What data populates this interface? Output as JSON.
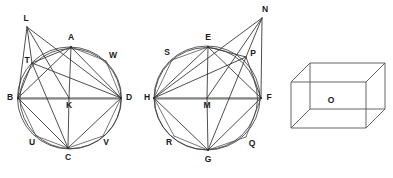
{
  "figure": {
    "background_color": "#ffffff",
    "ink_color": "#3a3a3a",
    "label_color": "#1a1a1a",
    "width": 393,
    "height": 178
  },
  "diagrams": [
    {
      "id": "left-circle-diagram",
      "name": "circle-with-inscribed-quadrilateral-abcd",
      "center": {
        "x": 69.5,
        "y": 98
      },
      "radius": 52,
      "points": [
        {
          "key": "A",
          "label": "A",
          "x": 71,
          "y": 47,
          "label_x": 71,
          "label_y": 38,
          "on_circle": true,
          "role": "top-vertex"
        },
        {
          "key": "B",
          "label": "B",
          "x": 18,
          "y": 98,
          "label_x": 10,
          "label_y": 98,
          "on_circle": true,
          "role": "left-vertex"
        },
        {
          "key": "C",
          "label": "C",
          "x": 68,
          "y": 148,
          "label_x": 68,
          "label_y": 158,
          "on_circle": true,
          "role": "bottom-vertex"
        },
        {
          "key": "D",
          "label": "D",
          "x": 121,
          "y": 98,
          "label_x": 129,
          "label_y": 98,
          "on_circle": true,
          "role": "right-vertex"
        },
        {
          "key": "K",
          "label": "K",
          "x": 69,
          "y": 98,
          "label_x": 69,
          "label_y": 106,
          "on_circle": false,
          "role": "center"
        },
        {
          "key": "L",
          "label": "L",
          "x": 27,
          "y": 27,
          "label_x": 26,
          "label_y": 19,
          "on_circle": false,
          "role": "external-apex"
        },
        {
          "key": "T",
          "label": "T",
          "x": 32,
          "y": 63,
          "label_x": 27,
          "label_y": 61,
          "on_circle": true,
          "role": "upper-left-arc"
        },
        {
          "key": "W",
          "label": "W",
          "x": 106,
          "y": 61,
          "label_x": 113,
          "label_y": 56,
          "on_circle": true,
          "role": "upper-right-arc"
        },
        {
          "key": "U",
          "label": "U",
          "x": 36,
          "y": 136,
          "label_x": 32,
          "label_y": 143,
          "on_circle": true,
          "role": "lower-left-arc"
        },
        {
          "key": "V",
          "label": "V",
          "x": 103,
          "y": 136,
          "label_x": 106,
          "label_y": 143,
          "on_circle": true,
          "role": "lower-right-arc"
        }
      ],
      "segments": [
        [
          "B",
          "D"
        ],
        [
          "A",
          "B"
        ],
        [
          "A",
          "D"
        ],
        [
          "B",
          "C"
        ],
        [
          "C",
          "D"
        ],
        [
          "A",
          "K"
        ],
        [
          "C",
          "K"
        ],
        [
          "A",
          "C"
        ],
        [
          "L",
          "B"
        ],
        [
          "L",
          "T"
        ],
        [
          "L",
          "K"
        ],
        [
          "L",
          "D"
        ],
        [
          "T",
          "B"
        ],
        [
          "T",
          "D"
        ],
        [
          "T",
          "A"
        ],
        [
          "T",
          "C"
        ],
        [
          "A",
          "W"
        ],
        [
          "W",
          "D"
        ],
        [
          "B",
          "U"
        ],
        [
          "U",
          "C"
        ],
        [
          "C",
          "V"
        ],
        [
          "V",
          "D"
        ],
        [
          "B",
          "K"
        ],
        [
          "K",
          "D"
        ]
      ]
    },
    {
      "id": "middle-circle-diagram",
      "name": "circle-with-inscribed-quadrilateral-efgh",
      "center": {
        "x": 207,
        "y": 98
      },
      "radius": 53,
      "points": [
        {
          "key": "E",
          "label": "E",
          "x": 208,
          "y": 47,
          "label_x": 208,
          "label_y": 38,
          "on_circle": true,
          "role": "top-vertex"
        },
        {
          "key": "H",
          "label": "H",
          "x": 154,
          "y": 98,
          "label_x": 147,
          "label_y": 98,
          "on_circle": true,
          "role": "left-vertex"
        },
        {
          "key": "G",
          "label": "G",
          "x": 208,
          "y": 150,
          "label_x": 208,
          "label_y": 160,
          "on_circle": true,
          "role": "bottom-vertex"
        },
        {
          "key": "F",
          "label": "F",
          "x": 261,
          "y": 98,
          "label_x": 269,
          "label_y": 98,
          "on_circle": true,
          "role": "right-vertex"
        },
        {
          "key": "M",
          "label": "M",
          "x": 207,
          "y": 98,
          "label_x": 207,
          "label_y": 106,
          "on_circle": false,
          "role": "center"
        },
        {
          "key": "N",
          "label": "N",
          "x": 262,
          "y": 18,
          "label_x": 265,
          "label_y": 10,
          "on_circle": false,
          "role": "external-apex"
        },
        {
          "key": "P",
          "label": "P",
          "x": 246,
          "y": 57,
          "label_x": 253,
          "label_y": 54,
          "on_circle": true,
          "role": "upper-right-arc"
        },
        {
          "key": "S",
          "label": "S",
          "x": 172,
          "y": 60,
          "label_x": 167,
          "label_y": 53,
          "on_circle": true,
          "role": "upper-left-arc"
        },
        {
          "key": "R",
          "label": "R",
          "x": 174,
          "y": 136,
          "label_x": 169,
          "label_y": 143,
          "on_circle": true,
          "role": "lower-left-arc"
        },
        {
          "key": "Q",
          "label": "Q",
          "x": 246,
          "y": 137,
          "label_x": 252,
          "label_y": 144,
          "on_circle": true,
          "role": "lower-right-arc"
        }
      ],
      "segments": [
        [
          "H",
          "F"
        ],
        [
          "E",
          "H"
        ],
        [
          "E",
          "F"
        ],
        [
          "H",
          "G"
        ],
        [
          "G",
          "F"
        ],
        [
          "E",
          "M"
        ],
        [
          "G",
          "M"
        ],
        [
          "E",
          "G"
        ],
        [
          "N",
          "F"
        ],
        [
          "N",
          "P"
        ],
        [
          "N",
          "M"
        ],
        [
          "N",
          "H"
        ],
        [
          "P",
          "F"
        ],
        [
          "P",
          "H"
        ],
        [
          "P",
          "E"
        ],
        [
          "P",
          "G"
        ],
        [
          "E",
          "S"
        ],
        [
          "S",
          "H"
        ],
        [
          "H",
          "R"
        ],
        [
          "R",
          "G"
        ],
        [
          "G",
          "Q"
        ],
        [
          "Q",
          "F"
        ],
        [
          "H",
          "M"
        ],
        [
          "M",
          "F"
        ]
      ]
    }
  ],
  "box": {
    "id": "right-box-diagram",
    "name": "rectangular-box-wireframe",
    "label": "O",
    "label_x": 331,
    "label_y": 101,
    "front_face": {
      "left": 291,
      "top": 82,
      "right": 366,
      "bottom": 128
    },
    "depth_offset": {
      "dx": 19,
      "dy": -19
    },
    "hidden_edges_visible": true
  }
}
